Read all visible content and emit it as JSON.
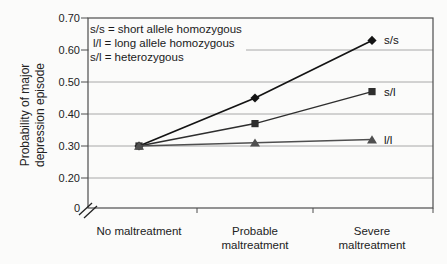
{
  "chart_data": {
    "type": "line",
    "title": "",
    "categories": [
      "No maltreatment",
      "Probable maltreatment",
      "Severe maltreatment"
    ],
    "series": [
      {
        "name": "s/s",
        "end_label": "s/s",
        "values": [
          0.3,
          0.45,
          0.63
        ],
        "marker": "diamond",
        "color": "#141414"
      },
      {
        "name": "s/l",
        "end_label": "s/l",
        "values": [
          0.3,
          0.37,
          0.47
        ],
        "marker": "square",
        "color": "#2e2e2e"
      },
      {
        "name": "l/l",
        "end_label": "l/l",
        "values": [
          0.3,
          0.31,
          0.32
        ],
        "marker": "triangle",
        "color": "#4f4f4f"
      }
    ],
    "xlabel": "",
    "ylabel": "Probability of major depression episode",
    "ylim": [
      0,
      0.7
    ],
    "y_ticks": [
      0.7,
      0.6,
      0.5,
      0.4,
      0.3,
      0.2,
      0
    ],
    "y_axis_break": true,
    "grid": "horizontal-light",
    "legend_position": "top-left-inside"
  },
  "y_axis": {
    "label_lines": [
      "Probability of major",
      "depression episode"
    ],
    "tick_labels": [
      "0.70",
      "0.60",
      "0.50",
      "0.40",
      "0.30",
      "0.20",
      "0"
    ],
    "tick_values": [
      0.7,
      0.6,
      0.5,
      0.4,
      0.3,
      0.2,
      0
    ]
  },
  "x_axis": {
    "labels": [
      {
        "lines": [
          "No maltreatment"
        ]
      },
      {
        "lines": [
          "Probable",
          "maltreatment"
        ]
      },
      {
        "lines": [
          "Severe",
          "maltreatment"
        ]
      }
    ]
  },
  "legend": {
    "lines": [
      "s/s = short allele homozygous",
      "l/l = long allele homozygous",
      "s/l = heterozygous"
    ]
  },
  "colors": {
    "grid": "#a8a8a8",
    "border": "#4d4d4d",
    "axis_break": "#222222",
    "text": "#1a1a1a"
  }
}
